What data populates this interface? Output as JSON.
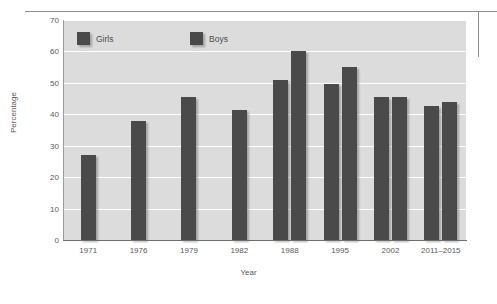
{
  "chart_data": {
    "type": "bar",
    "title": "",
    "xlabel": "Year",
    "ylabel": "Percentage",
    "categories": [
      "1971",
      "1976",
      "1979",
      "1982",
      "1988",
      "1995",
      "2002",
      "2011–2015"
    ],
    "series": [
      {
        "name": "Girls",
        "values": [
          27,
          38,
          45.5,
          41.5,
          51,
          49.5,
          45.5,
          42.5
        ]
      },
      {
        "name": "Boys",
        "values": [
          null,
          null,
          null,
          null,
          60,
          55,
          45.5,
          44
        ]
      }
    ],
    "ylim": [
      0,
      70
    ],
    "yticks": [
      0,
      10,
      20,
      30,
      40,
      50,
      60,
      70
    ],
    "grid": true,
    "legend_position": "top-inside",
    "colors": {
      "bar": "#4a4a4a",
      "plot_background": "#dcdcdc",
      "gridline": "#ffffff",
      "axis": "#6e6e6e",
      "text": "#595959"
    }
  }
}
